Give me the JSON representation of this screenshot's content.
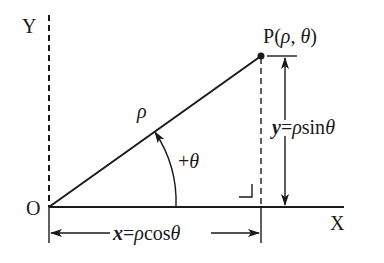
{
  "diagram": {
    "labels": {
      "y_axis": "Y",
      "x_axis": "X",
      "origin": "O",
      "point": "P(ρ, θ)",
      "point_name": "P",
      "point_open": "(",
      "point_rho": "ρ",
      "point_sep": ", ",
      "point_theta": "θ",
      "point_close": ")",
      "radius": "ρ",
      "angle": "+θ",
      "y_formula": "y=ρsinθ",
      "y_formula_var": "y",
      "y_formula_eq": "=",
      "y_formula_rho": "ρ",
      "y_formula_fn": "sin",
      "y_formula_theta": "θ",
      "x_formula": "x=ρcosθ",
      "x_formula_var": "x",
      "x_formula_eq": "=",
      "x_formula_rho": "ρ",
      "x_formula_fn": "cos",
      "x_formula_theta": "θ",
      "angle_plus": "+",
      "angle_theta": "θ"
    },
    "colors": {
      "stroke": "#1a1a1a",
      "background": "#ffffff"
    }
  }
}
